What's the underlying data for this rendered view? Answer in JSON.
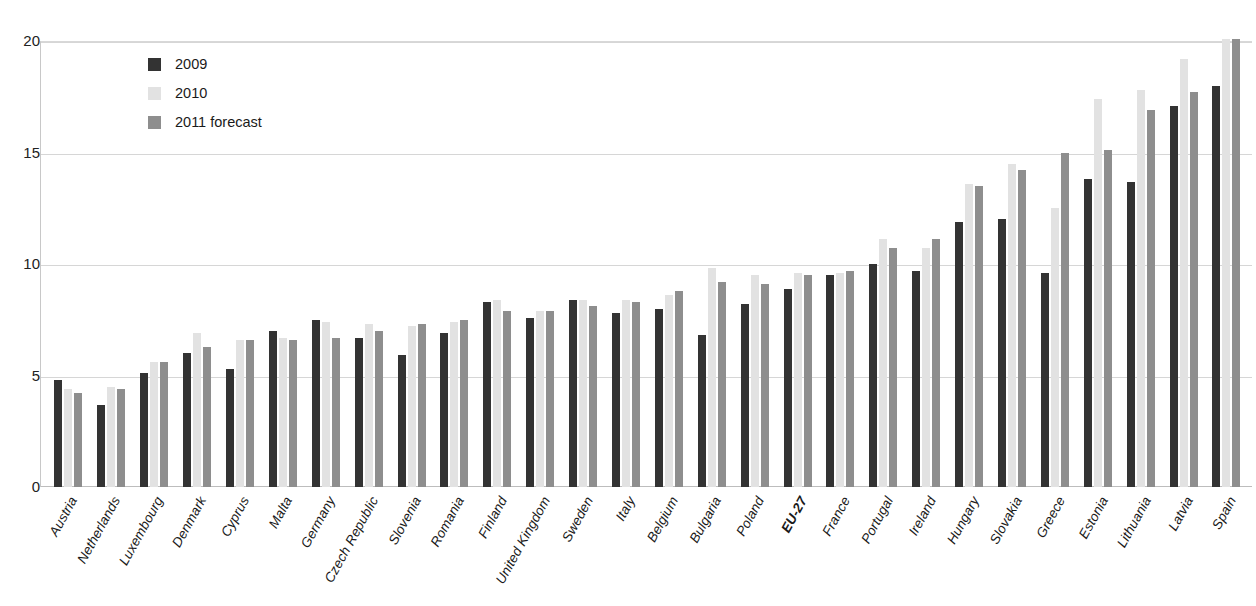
{
  "chart_data": {
    "type": "bar",
    "title": "",
    "subtitle": "",
    "xlabel": "",
    "ylabel": "",
    "ylim": [
      0,
      20
    ],
    "yticks": [
      0,
      5,
      10,
      15,
      20
    ],
    "grid": true,
    "legend_position": "top-left-inside",
    "categories": [
      "Austria",
      "Netherlands",
      "Luxembourg",
      "Denmark",
      "Cyprus",
      "Malta",
      "Germany",
      "Czech Republic",
      "Slovenia",
      "Romania",
      "Finland",
      "United Kingdom",
      "Sweden",
      "Italy",
      "Belgium",
      "Bulgaria",
      "Poland",
      "EU-27",
      "France",
      "Portugal",
      "Ireland",
      "Hungary",
      "Slovakia",
      "Greece",
      "Estonia",
      "Lithuania",
      "Latvia",
      "Spain"
    ],
    "highlight_categories": [
      "EU-27"
    ],
    "series": [
      {
        "name": "2009",
        "color": "#333333",
        "values": [
          4.8,
          3.7,
          5.1,
          6.0,
          5.3,
          7.0,
          7.5,
          6.7,
          5.9,
          6.9,
          8.3,
          7.6,
          8.4,
          7.8,
          8.0,
          6.8,
          8.2,
          8.9,
          9.5,
          10.0,
          9.7,
          11.9,
          12.0,
          9.6,
          13.8,
          13.7,
          17.1,
          18.0
        ]
      },
      {
        "name": "2010",
        "color": "#e2e2e2",
        "values": [
          4.4,
          4.5,
          5.6,
          6.9,
          6.6,
          6.7,
          7.4,
          7.3,
          7.2,
          7.4,
          8.4,
          7.9,
          8.4,
          8.4,
          8.6,
          9.8,
          9.5,
          9.6,
          9.6,
          11.1,
          10.7,
          13.6,
          14.5,
          12.5,
          17.4,
          17.8,
          19.2,
          20.1
        ]
      },
      {
        "name": "2011 forecast",
        "color": "#8e8e8e",
        "values": [
          4.2,
          4.4,
          5.6,
          6.3,
          6.6,
          6.6,
          6.7,
          7.0,
          7.3,
          7.5,
          7.9,
          7.9,
          8.1,
          8.3,
          8.8,
          9.2,
          9.1,
          9.5,
          9.7,
          10.7,
          11.1,
          13.5,
          14.2,
          15.0,
          15.1,
          16.9,
          17.7,
          20.1
        ]
      }
    ]
  },
  "legend": {
    "items": [
      {
        "label": "2009",
        "key": "s2009"
      },
      {
        "label": "2010",
        "key": "s2010"
      },
      {
        "label": "2011 forecast",
        "key": "s2011"
      }
    ]
  }
}
